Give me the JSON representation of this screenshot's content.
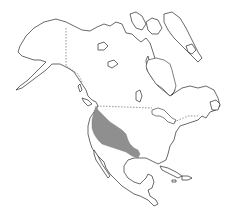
{
  "map": {
    "region": "North America",
    "colors": {
      "land_fill": "#ffffff",
      "coastline": "#2a2a2a",
      "border": "#555555",
      "range_fill": "#8f8f8f",
      "background": "#ffffff"
    },
    "features": [
      {
        "name": "Alaska",
        "type": "landmass"
      },
      {
        "name": "Canada",
        "type": "landmass"
      },
      {
        "name": "Greenland edge / Arctic islands",
        "type": "islands"
      },
      {
        "name": "Hudson Bay",
        "type": "water"
      },
      {
        "name": "Great Lakes",
        "type": "water"
      },
      {
        "name": "Gulf of Mexico",
        "type": "water"
      },
      {
        "name": "Caribbean islands",
        "type": "islands"
      },
      {
        "name": "Central America",
        "type": "landmass"
      }
    ],
    "range": {
      "label": "Shaded range",
      "description": "Western North America from southern British Columbia coast through the western United States into northern Mexico"
    }
  }
}
